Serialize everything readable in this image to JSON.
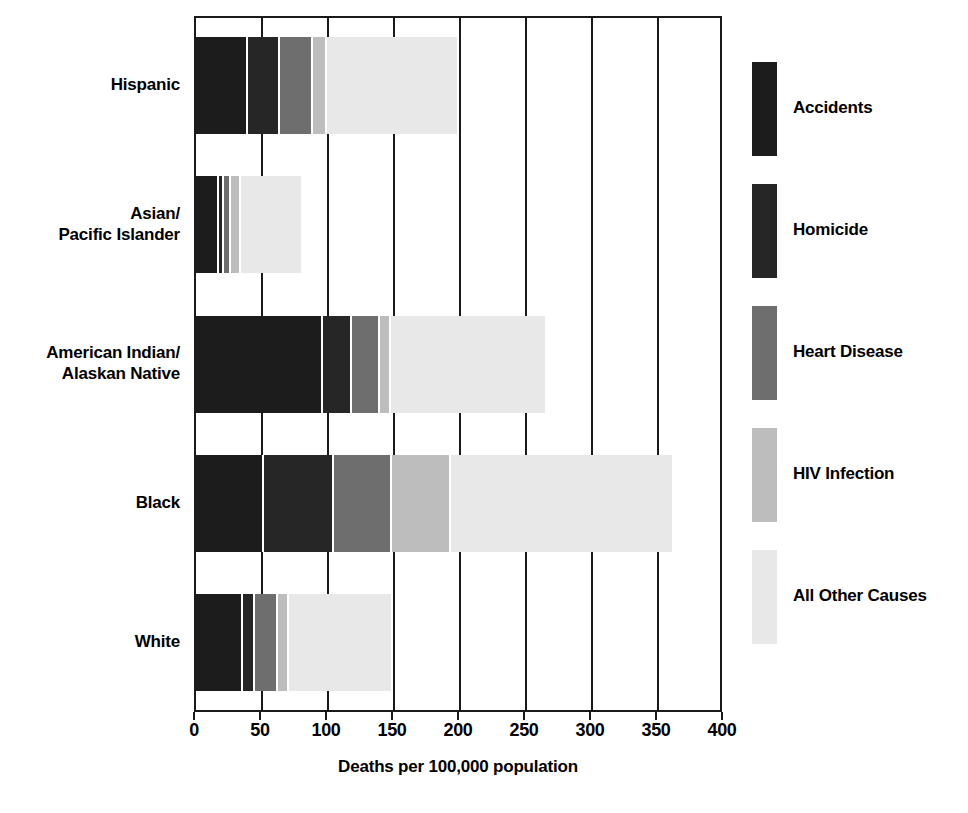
{
  "chart_data": {
    "type": "bar",
    "subtype": "horizontal-stacked",
    "title": "",
    "xlabel": "Deaths per 100,000 population",
    "ylabel": "",
    "xlim": [
      0,
      400
    ],
    "ylim": null,
    "grid": true,
    "legend_position": "right",
    "categories": [
      "Hispanic",
      "Asian/\nPacific Islander",
      "American Indian/\nAlaskan Native",
      "Black",
      "White"
    ],
    "series": [
      {
        "name": "Accidents",
        "color": "#1c1c1c",
        "values": [
          41,
          19,
          98,
          53,
          37
        ]
      },
      {
        "name": "Homicide",
        "color": "#262626",
        "values": [
          24,
          4,
          22,
          53,
          9
        ]
      },
      {
        "name": "Heart Disease",
        "color": "#6e6e6e",
        "values": [
          25,
          5,
          21,
          44,
          18
        ]
      },
      {
        "name": "HIV Infection",
        "color": "#bdbdbd",
        "values": [
          11,
          8,
          8,
          45,
          8
        ]
      },
      {
        "name": "All Other Causes",
        "color": "#e8e8e8",
        "values": [
          98,
          45,
          117,
          167,
          77
        ]
      }
    ],
    "totals": [
      199,
      81,
      266,
      362,
      149
    ],
    "xticks": [
      0,
      50,
      100,
      150,
      200,
      250,
      300,
      350,
      400
    ],
    "xtick_labels": [
      "0",
      "50",
      "100",
      "150",
      "200",
      "250",
      "300",
      "350",
      "400"
    ]
  },
  "axis": {
    "x_title": "Deaths per 100,000 population"
  },
  "legend": {
    "items": [
      {
        "label": "Accidents"
      },
      {
        "label": "Homicide"
      },
      {
        "label": "Heart Disease"
      },
      {
        "label": "HIV Infection"
      },
      {
        "label": "All Other Causes"
      }
    ]
  },
  "colors": {
    "accidents": "#1c1c1c",
    "homicide": "#262626",
    "heart_disease": "#6e6e6e",
    "hiv_infection": "#bdbdbd",
    "all_other_causes": "#e8e8e8",
    "axis": "#1a1a1a",
    "background": "#ffffff"
  }
}
